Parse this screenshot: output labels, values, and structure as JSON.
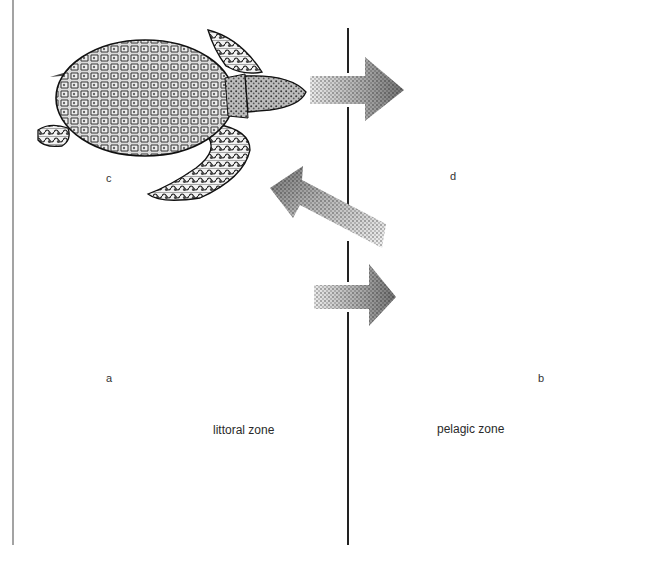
{
  "figure": {
    "colors": {
      "ink": "#1a1a1a",
      "frame_line": "#555555",
      "arrow_stipple": "#8a8a8a",
      "background": "#ffffff"
    }
  },
  "zones": {
    "littoral": {
      "label": "littoral zone"
    },
    "pelagic": {
      "label": "pelagic zone"
    }
  },
  "turtles": [
    {
      "id": "a",
      "label": "a",
      "kind": "hawksbill-like turtle with scute pattern",
      "zone": "littoral",
      "position": "bottom-left"
    },
    {
      "id": "b",
      "label": "b",
      "kind": "turtle with smooth spotted shell",
      "zone": "pelagic",
      "position": "bottom-right"
    },
    {
      "id": "c",
      "label": "c",
      "kind": "turtle with pebbled carapace",
      "zone": "littoral",
      "position": "top-left"
    },
    {
      "id": "d",
      "label": "d",
      "kind": "leatherback turtle with longitudinal ridges",
      "zone": "pelagic",
      "position": "top-right"
    }
  ],
  "arrows": [
    {
      "id": "c-to-d",
      "from": "c",
      "to": "d",
      "direction": "right"
    },
    {
      "id": "a-to-b",
      "from": "a",
      "to": "b",
      "direction": "right"
    },
    {
      "id": "b-to-c",
      "from": "b",
      "to": "c",
      "direction": "up-left"
    }
  ]
}
